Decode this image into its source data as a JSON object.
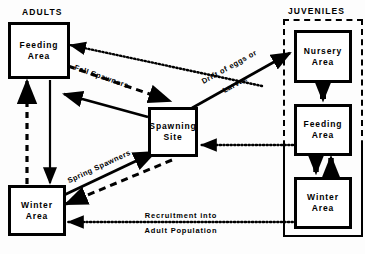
{
  "diagram": {
    "title_adults": "ADULTS",
    "title_juveniles": "JUVENILES",
    "nodes": {
      "adult_feeding": {
        "line1": "Feeding",
        "line2": "Area"
      },
      "adult_winter": {
        "line1": "Winter",
        "line2": "Area"
      },
      "spawning_site": {
        "line1": "Spawning",
        "line2": "Site"
      },
      "juv_nursery": {
        "line1": "Nursery",
        "line2": "Area"
      },
      "juv_feeding": {
        "line1": "Feeding",
        "line2": "Area"
      },
      "juv_winter": {
        "line1": "Winter",
        "line2": "Area"
      }
    },
    "edge_labels": {
      "fall_spawners": "Fall Spawners",
      "spring_spawners": "Spring Spawners",
      "drift_line1": "Drift of eggs or",
      "drift_line2": "Larvae",
      "recruitment_line1": "Recruitment into",
      "recruitment_line2": "Adult Population"
    },
    "colors": {
      "ink": "#000000",
      "paper": "#fdfdfd"
    }
  }
}
